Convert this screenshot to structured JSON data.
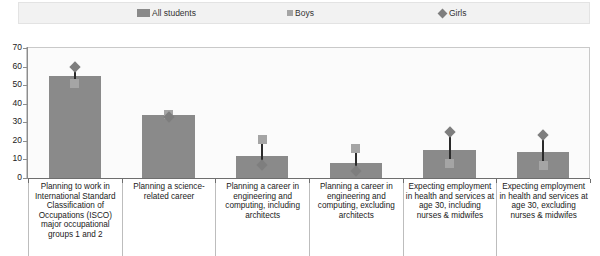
{
  "legend": {
    "items": [
      {
        "label": "All students",
        "marker": "bar-swatch",
        "color": "#8a8a8a"
      },
      {
        "label": "Boys",
        "marker": "square",
        "color": "#a5a5a5"
      },
      {
        "label": "Girls",
        "marker": "diamond",
        "color": "#7e7e7e"
      }
    ]
  },
  "axis": {
    "y_ticks": [
      "70",
      "60",
      "50",
      "40",
      "30",
      "20",
      "10",
      "0"
    ]
  },
  "chart_data": {
    "type": "bar",
    "title": "",
    "subtitle": "",
    "xlabel": "",
    "ylabel": "",
    "ylim": [
      0,
      70
    ],
    "ytick_step": 10,
    "grid": false,
    "legend_position": "top",
    "categories": [
      "Planning to work in International Standard Classification of Occupations (ISCO) major occupational groups 1 and 2",
      "Planning a science-related career",
      "Planning a career in engineering and computing, including architects",
      "Planning a career in engineering and computing, excluding architects",
      "Expecting employment in health and services at age 30, including nurses & midwifes",
      "Expecting employment in health and services at age 30, excluding nurses & midwifes"
    ],
    "series": [
      {
        "name": "All students",
        "type": "bar",
        "values": [
          55,
          34,
          12,
          8,
          15,
          14
        ]
      },
      {
        "name": "Boys",
        "type": "marker",
        "marker": "square",
        "values": [
          51,
          34,
          21,
          16,
          8,
          7
        ]
      },
      {
        "name": "Girls",
        "type": "marker",
        "marker": "diamond",
        "values": [
          60,
          33,
          7,
          4,
          25,
          23
        ]
      }
    ]
  }
}
